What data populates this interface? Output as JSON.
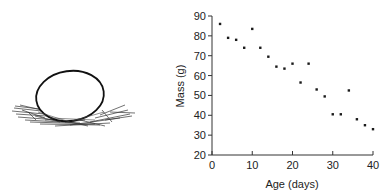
{
  "illustration": {
    "subject": "egg-in-nest"
  },
  "chart_data": {
    "type": "scatter",
    "title": "",
    "xlabel": "Age (days)",
    "ylabel": "Mass (g)",
    "xlim": [
      0,
      40
    ],
    "ylim": [
      20,
      90
    ],
    "xticks": [
      0,
      10,
      20,
      30,
      40
    ],
    "yticks": [
      20,
      30,
      40,
      50,
      60,
      70,
      80,
      90
    ],
    "grid": false,
    "legend": null,
    "series": [
      {
        "name": "egg mass",
        "x": [
          2,
          4,
          6,
          8,
          10,
          12,
          14,
          16,
          18,
          20,
          22,
          24,
          26,
          28,
          30,
          32,
          34,
          36,
          38,
          40
        ],
        "y": [
          86,
          79,
          78,
          74,
          83.5,
          74,
          69.5,
          64.5,
          63.5,
          66,
          56.5,
          66,
          53,
          49.5,
          40.5,
          40.5,
          52.5,
          38,
          35,
          33
        ],
        "marker": "dot",
        "color": "#1a1a1a"
      }
    ]
  }
}
